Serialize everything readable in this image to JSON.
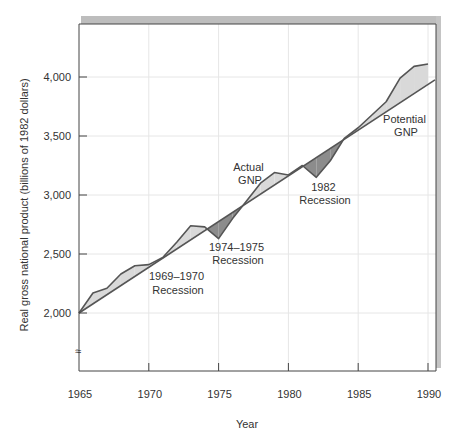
{
  "chart_data": {
    "type": "area",
    "title": "",
    "xlabel": "Year",
    "ylabel": "Real gross national product (billions of 1982 dollars)",
    "xlim": [
      1965,
      1990.5
    ],
    "ylim": [
      1500,
      4450
    ],
    "x_ticks": [
      1965,
      1970,
      1975,
      1980,
      1985,
      1990
    ],
    "x_tick_labels": [
      "1965",
      "1970",
      "1975",
      "1980",
      "1985",
      "1990"
    ],
    "y_ticks": [
      2000,
      2500,
      3000,
      3500,
      4000
    ],
    "y_tick_labels": [
      "2,000",
      "2,500",
      "3,000",
      "3,500",
      "4,000"
    ],
    "y_axis_break": true,
    "grid": true,
    "legend": null,
    "series": [
      {
        "name": "Actual GNP",
        "x": [
          1965,
          1966,
          1967,
          1968,
          1969,
          1970,
          1971,
          1972,
          1973,
          1974,
          1975,
          1976,
          1977,
          1978,
          1979,
          1980,
          1981,
          1982,
          1983,
          1984,
          1985,
          1986,
          1987,
          1988,
          1989,
          1990
        ],
        "values": [
          2000,
          2170,
          2210,
          2330,
          2400,
          2410,
          2470,
          2600,
          2740,
          2730,
          2630,
          2800,
          2950,
          3100,
          3190,
          3170,
          3250,
          3150,
          3290,
          3480,
          3570,
          3680,
          3790,
          3990,
          4090,
          4110
        ]
      },
      {
        "name": "Potential GNP",
        "x": [
          1965,
          1990.5
        ],
        "values": [
          2000,
          3975
        ]
      }
    ],
    "shading": {
      "above_potential": "#d9d9d9",
      "below_potential": "#8c8c8c"
    },
    "annotations": [
      {
        "text": "1969–1970\nRecession",
        "x": 1970.8,
        "y": 2310
      },
      {
        "text": "1974–1975\nRecession",
        "x": 1976.0,
        "y": 2540
      },
      {
        "text": "Actual\nGNP",
        "x": 1977.8,
        "y": 3230
      },
      {
        "text": "1982\nRecession",
        "x": 1982.4,
        "y": 3060
      },
      {
        "text": "Potential\nGNP",
        "x": 1989.0,
        "y": 3700
      }
    ]
  },
  "labels": {
    "xlabel": "Year",
    "ylabel": "Real gross national product (billions of 1982 dollars)",
    "break_mark": "≈",
    "annot_1969_l1": "1969–1970",
    "annot_1969_l2": "Recession",
    "annot_1974_l1": "1974–1975",
    "annot_1974_l2": "Recession",
    "annot_actual_l1": "Actual",
    "annot_actual_l2": "GNP",
    "annot_1982_l1": "1982",
    "annot_1982_l2": "Recession",
    "annot_potential_l1": "Potential",
    "annot_potential_l2": "GNP"
  },
  "colors": {
    "frame_shadow": "#bdbdbd",
    "axis": "#444444",
    "grid": "#e6e6e6",
    "line": "#555555",
    "fill_above": "#d9d9d9",
    "fill_below": "#8c8c8c"
  }
}
